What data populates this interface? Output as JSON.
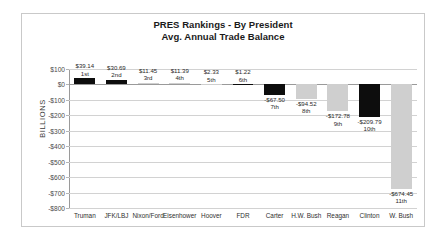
{
  "chart_data": {
    "type": "bar",
    "title": "PRES Rankings - By President",
    "subtitle": "Avg. Annual Trade Balance",
    "xlabel": "",
    "ylabel": "BILLIONS",
    "ylim": [
      -800,
      100
    ],
    "ytick_step": 100,
    "grid": true,
    "legend": "none",
    "categories": [
      "Truman",
      "JFK/LBJ",
      "Nixon/Ford",
      "Eisenhower",
      "Hoover",
      "FDR",
      "Carter",
      "H.W. Bush",
      "Reagan",
      "Clinton",
      "W. Bush"
    ],
    "values": [
      39.14,
      30.69,
      11.45,
      11.39,
      2.33,
      1.22,
      -67.5,
      -94.52,
      -172.78,
      -209.79,
      -674.45
    ],
    "value_labels": [
      "$39.14",
      "$30.69",
      "$11.45",
      "$11.39",
      "$2.33",
      "$1.22",
      "-$67.50",
      "-$94.52",
      "-$172.78",
      "-$209.79",
      "-$674.45"
    ],
    "rank_labels": [
      "1st",
      "2nd",
      "3rd",
      "4th",
      "5th",
      "6th",
      "7th",
      "8th",
      "9th",
      "10th",
      "11th"
    ],
    "bar_colors": [
      "black",
      "black",
      "gray",
      "gray",
      "gray",
      "black",
      "black",
      "gray",
      "gray",
      "black",
      "gray"
    ],
    "ytick_labels": [
      "$100",
      "$0",
      "-$100",
      "-$200",
      "-$300",
      "-$400",
      "-$500",
      "-$600",
      "-$700",
      "-$800"
    ],
    "ytick_values": [
      100,
      0,
      -100,
      -200,
      -300,
      -400,
      -500,
      -600,
      -700,
      -800
    ],
    "colors": {
      "black": "#0d0d0d",
      "gray": "#cfcfcf",
      "gridline": "#d2d2d2",
      "axis": "#9a9a9a",
      "border": "#c9c9c9",
      "text": "#2a2a2a"
    }
  }
}
